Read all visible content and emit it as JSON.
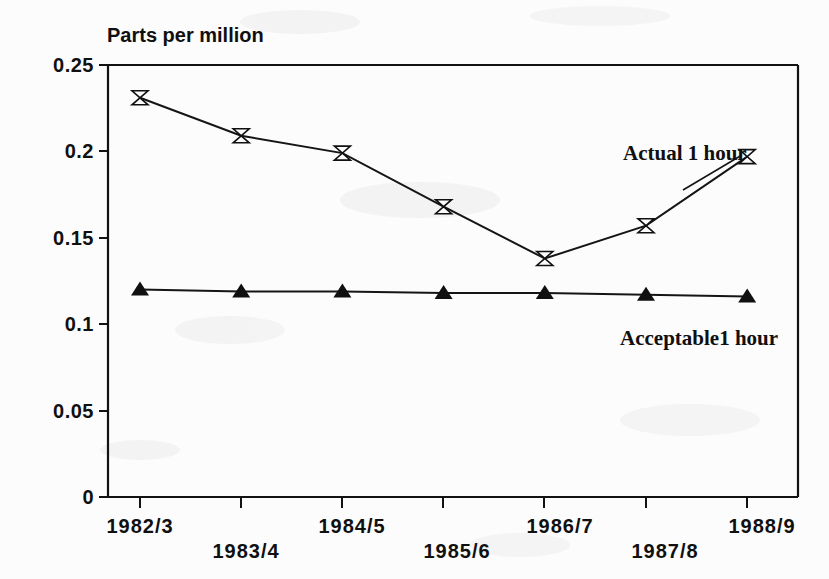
{
  "figure": {
    "axis_title": "Parts per million",
    "background_color": "#fcfcfc",
    "ink_color": "#101010"
  },
  "annotations": {
    "actual_label": "Actual 1 hour",
    "acceptable_label": "Acceptable1 hour"
  },
  "axes": {
    "y_ticks": [
      "0",
      "0.05",
      "0.1",
      "0.15",
      "0.2",
      "0.25"
    ],
    "x_ticks": [
      "1982/3",
      "1983/4",
      "1984/5",
      "1985/6",
      "1986/7",
      "1987/8",
      "1988/9"
    ]
  },
  "chart_data": {
    "type": "line",
    "title": "",
    "subtitle": "",
    "xlabel": "",
    "ylabel": "Parts per million",
    "ylim": [
      0,
      0.25
    ],
    "yticks": [
      0,
      0.05,
      0.1,
      0.15,
      0.2,
      0.25
    ],
    "ytick_labels": [
      "0",
      "0.05",
      "0.1",
      "0.15",
      "0.2",
      "0.25"
    ],
    "grid": false,
    "legend": "annotations-inline",
    "categories": [
      "1982/3",
      "1983/4",
      "1984/5",
      "1985/6",
      "1986/7",
      "1987/8",
      "1988/9"
    ],
    "series": [
      {
        "name": "Actual 1 hour",
        "marker": "bowtie-open",
        "values": [
          0.231,
          0.209,
          0.199,
          0.168,
          0.138,
          0.157,
          0.197
        ]
      },
      {
        "name": "Acceptable1 hour",
        "marker": "triangle-filled",
        "values": [
          0.12,
          0.119,
          0.119,
          0.118,
          0.118,
          0.117,
          0.116
        ]
      }
    ]
  }
}
